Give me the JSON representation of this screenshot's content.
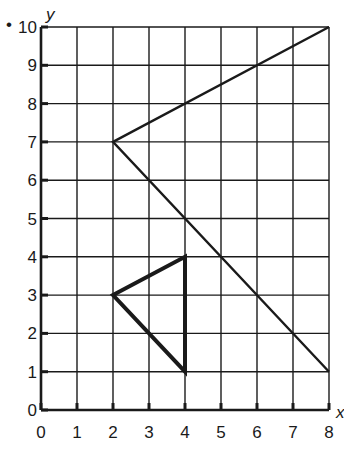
{
  "chart_data": {
    "type": "line",
    "title": "",
    "xlabel": "x",
    "ylabel": "y",
    "xlim": [
      0,
      8
    ],
    "ylim": [
      0,
      10
    ],
    "grid": true,
    "x_ticks": [
      "0",
      "1",
      "2",
      "3",
      "4",
      "5",
      "6",
      "7",
      "8"
    ],
    "y_ticks": [
      "0",
      "1",
      "2",
      "3",
      "4",
      "5",
      "6",
      "7",
      "8",
      "9",
      "10"
    ],
    "series": [
      {
        "name": "large-figure",
        "points": [
          [
            8,
            10
          ],
          [
            2,
            7
          ],
          [
            8,
            1
          ]
        ],
        "closed": false,
        "stroke_width": "thin"
      },
      {
        "name": "small-triangle",
        "points": [
          [
            2,
            3
          ],
          [
            4,
            4
          ],
          [
            4,
            1
          ]
        ],
        "closed": true,
        "stroke_width": "thick"
      }
    ]
  },
  "labels": {
    "bullet": "•",
    "x_axis": "x",
    "y_axis": "y"
  },
  "colors": {
    "line": "#1a1a1a",
    "grid": "#1a1a1a",
    "background": "#ffffff"
  }
}
